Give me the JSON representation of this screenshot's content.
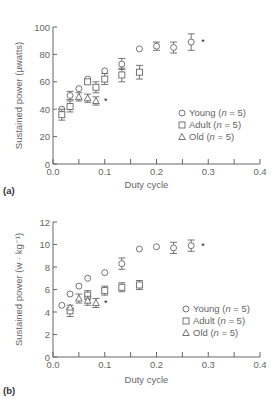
{
  "chart_data": [
    {
      "type": "scatter",
      "panel_label": "(a)",
      "xlabel": "Duty cycle",
      "ylabel": "Sustained power (µwatts)",
      "xlim": [
        0,
        0.4
      ],
      "ylim": [
        0,
        100
      ],
      "xticks": [
        "0.0",
        "0.1",
        "0.2",
        "0.3",
        "0.4"
      ],
      "yticks": [
        "0",
        "20",
        "40",
        "60",
        "80",
        "100"
      ],
      "legend": [
        "Young (n = 5)",
        "Adult (n = 5)",
        "Old (n = 5)"
      ],
      "legend_position": "lower right",
      "annotation": "*",
      "series": [
        {
          "name": "Young (n = 5)",
          "marker": "circle",
          "x": [
            0.017,
            0.033,
            0.05,
            0.067,
            0.1,
            0.133,
            0.167,
            0.2,
            0.233,
            0.267
          ],
          "y": [
            40,
            50,
            55,
            62,
            68,
            73,
            84,
            86,
            85,
            89
          ],
          "err": [
            0,
            3,
            0,
            0,
            0,
            4,
            0,
            3,
            4,
            6
          ]
        },
        {
          "name": "Adult (n = 5)",
          "marker": "square",
          "x": [
            0.017,
            0.033,
            0.067,
            0.083,
            0.1,
            0.133,
            0.167
          ],
          "y": [
            36,
            42,
            60,
            56,
            62,
            65,
            67
          ],
          "err": [
            4,
            4,
            0,
            4,
            4,
            5,
            5
          ]
        },
        {
          "name": "Old (n = 5)",
          "marker": "triangle",
          "x": [
            0.05,
            0.067,
            0.083
          ],
          "y": [
            49,
            48,
            46
          ],
          "err": [
            3,
            3,
            3
          ]
        }
      ]
    },
    {
      "type": "scatter",
      "panel_label": "(b)",
      "xlabel": "Duty cycle",
      "ylabel": "Sustained power (w · kg⁻¹)",
      "xlim": [
        0,
        0.4
      ],
      "ylim": [
        0,
        12
      ],
      "xticks": [
        "0.0",
        "0.1",
        "0.2",
        "0.3",
        "0.4"
      ],
      "yticks": [
        "0",
        "2",
        "4",
        "6",
        "8",
        "10",
        "12"
      ],
      "legend": [
        "Young (n = 5)",
        "Adult (n = 5)",
        "Old (n = 5)"
      ],
      "legend_position": "lower right",
      "annotation": "*",
      "series": [
        {
          "name": "Young (n = 5)",
          "marker": "circle",
          "x": [
            0.017,
            0.033,
            0.05,
            0.067,
            0.1,
            0.133,
            0.167,
            0.2,
            0.233,
            0.267
          ],
          "y": [
            4.6,
            5.6,
            6.3,
            7.0,
            7.5,
            8.3,
            9.6,
            9.8,
            9.7,
            9.9
          ],
          "err": [
            0,
            0,
            0,
            0,
            0,
            0.5,
            0,
            0,
            0.5,
            0.5
          ]
        },
        {
          "name": "Adult (n = 5)",
          "marker": "square",
          "x": [
            0.033,
            0.067,
            0.1,
            0.133,
            0.167
          ],
          "y": [
            4.1,
            5.5,
            5.9,
            6.2,
            6.4
          ],
          "err": [
            0.5,
            0.4,
            0.4,
            0.4,
            0.4
          ]
        },
        {
          "name": "Old (n = 5)",
          "marker": "triangle",
          "x": [
            0.033,
            0.05,
            0.067,
            0.083
          ],
          "y": [
            4.4,
            5.2,
            5.0,
            4.8
          ],
          "err": [
            0,
            0.4,
            0.4,
            0.4
          ]
        }
      ]
    }
  ]
}
